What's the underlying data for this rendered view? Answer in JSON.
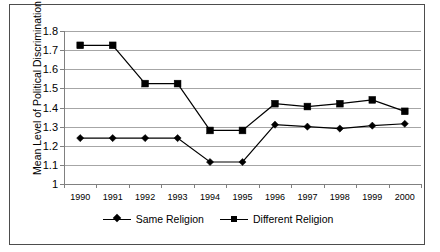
{
  "chart_data": {
    "type": "line",
    "title": "",
    "xlabel": "",
    "ylabel": "Mean Level of Political Discrimination",
    "categories": [
      "1990",
      "1991",
      "1992",
      "1993",
      "1994",
      "1995",
      "1996",
      "1997",
      "1998",
      "1999",
      "2000"
    ],
    "ylim": [
      1.0,
      1.8
    ],
    "ytick_labels": [
      "1",
      "1.1",
      "1.2",
      "1.3",
      "1.4",
      "1.5",
      "1.6",
      "1.7",
      "1.8"
    ],
    "ytick_values": [
      1.0,
      1.1,
      1.2,
      1.3,
      1.4,
      1.5,
      1.6,
      1.7,
      1.8
    ],
    "grid": true,
    "legend_position": "bottom",
    "series": [
      {
        "name": "Same Religion",
        "marker": "diamond",
        "color": "#000000",
        "values": [
          1.24,
          1.24,
          1.24,
          1.24,
          1.115,
          1.115,
          1.31,
          1.3,
          1.29,
          1.305,
          1.315
        ]
      },
      {
        "name": "Different Religion",
        "marker": "square",
        "color": "#000000",
        "values": [
          1.725,
          1.725,
          1.525,
          1.525,
          1.28,
          1.28,
          1.42,
          1.405,
          1.42,
          1.44,
          1.38
        ]
      }
    ]
  },
  "legend": {
    "items": [
      {
        "label": "Same Religion"
      },
      {
        "label": "Different Religion"
      }
    ]
  }
}
